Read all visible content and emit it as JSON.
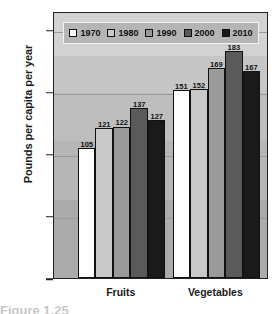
{
  "chart_data": {
    "type": "bar",
    "title": "",
    "xlabel": "",
    "ylabel": "Pounds per capita per year",
    "categories": [
      "Fruits",
      "Vegetables"
    ],
    "series": [
      {
        "name": "1970",
        "color": "#ffffff",
        "values": [
          105,
          151
        ]
      },
      {
        "name": "1980",
        "color": "#c9c9c9",
        "values": [
          121,
          152
        ]
      },
      {
        "name": "1990",
        "color": "#9a9a9a",
        "values": [
          122,
          169
        ]
      },
      {
        "name": "2000",
        "color": "#5a5a5a",
        "values": [
          137,
          183
        ]
      },
      {
        "name": "2010",
        "color": "#1a1a1a",
        "values": [
          127,
          167
        ]
      }
    ],
    "ylim": [
      0,
      215
    ],
    "yticks": [
      0,
      50,
      100,
      150,
      200
    ],
    "ytick_labels": [
      "0",
      "50",
      "100",
      "150",
      "200"
    ],
    "gridlines": [
      50,
      100,
      150,
      200
    ],
    "grid": true,
    "legend_position": "top-inside",
    "plot_background": "#b8b8b8",
    "axis_color": "#222222"
  },
  "legend": {
    "items": [
      {
        "label": "1970",
        "color": "#ffffff"
      },
      {
        "label": "1980",
        "color": "#c9c9c9"
      },
      {
        "label": "1990",
        "color": "#9a9a9a"
      },
      {
        "label": "2000",
        "color": "#5a5a5a"
      },
      {
        "label": "2010",
        "color": "#1a1a1a"
      }
    ]
  },
  "caption": {
    "text": "Figure 1.25"
  }
}
